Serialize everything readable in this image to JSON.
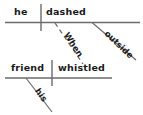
{
  "diagram": {
    "type": "reed-kellogg-sentence-diagram",
    "sentence": "When his friend whistled, he dashed outside.",
    "line_color": "#6b6b6b",
    "text_color": "#1a1a1a",
    "background_color": "#ffffff",
    "clauses": [
      {
        "name": "independent-clause",
        "subject": "he",
        "predicate": "dashed",
        "modifiers": [
          {
            "word": "outside",
            "attaches_to": "dashed",
            "line_style": "solid",
            "role": "adverb"
          }
        ]
      },
      {
        "name": "subordinate-clause",
        "subject": "friend",
        "predicate": "whistled",
        "modifiers": [
          {
            "word": "his",
            "attaches_to": "friend",
            "line_style": "solid",
            "role": "possessive-adjective"
          }
        ]
      }
    ],
    "connector": {
      "word": "When",
      "line_style": "dashed",
      "from": "dashed",
      "to": "whistled",
      "role": "subordinating-conjunction"
    },
    "labels": {
      "top_subject": "he",
      "top_predicate": "dashed",
      "top_modifier": "outside",
      "connector": "When",
      "bottom_subject": "friend",
      "bottom_predicate": "whistled",
      "bottom_modifier": "his"
    }
  }
}
